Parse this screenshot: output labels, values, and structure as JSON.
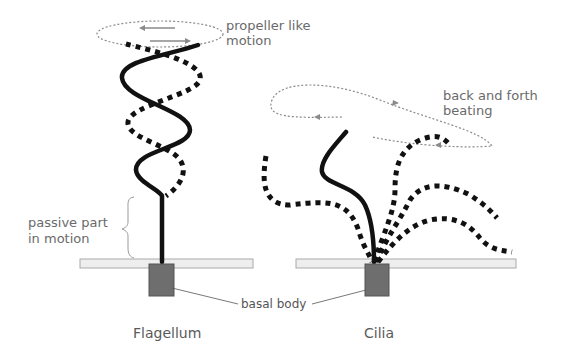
{
  "labels": {
    "propeller_line1": "propeller like",
    "propeller_line2": "motion",
    "back_forth_line1": "back and forth",
    "back_forth_line2": "beating",
    "passive_line1": "passive part",
    "passive_line2": "in motion",
    "basal_body": "basal body",
    "flagellum": "Flagellum",
    "cilia": "Cilia"
  },
  "colors": {
    "stroke": "#111111",
    "membrane_fill": "#eeeeee",
    "membrane_stroke": "#aaaaaa",
    "basal_body": "#6e6e6e",
    "motion_path": "#8a8a8a",
    "text": "#6a6a6a"
  }
}
